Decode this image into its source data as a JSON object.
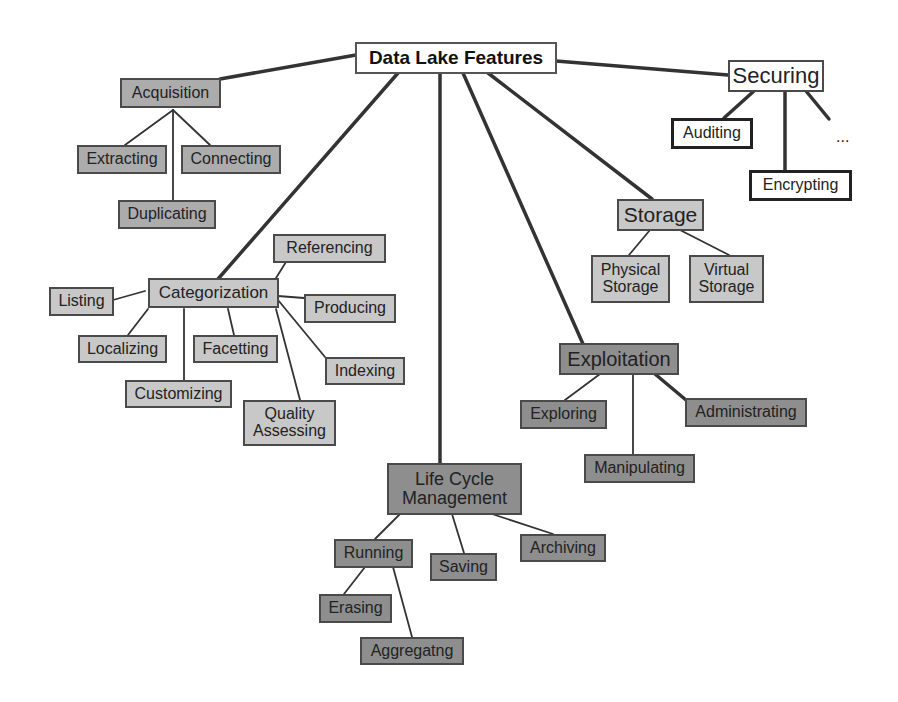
{
  "diagram": {
    "title": "Data Lake Features",
    "colors": {
      "root_fill": "#ffffff",
      "securing_fill": "#ffffff",
      "acquisition_fill": "#acacac",
      "categorization_fill": "#c8c8c8",
      "storage_fill": "#c8c8c8",
      "exploitation_fill": "#8e8e8e",
      "lifecycle_fill": "#8e8e8e",
      "line": "#333333"
    },
    "root": {
      "label": "Data Lake Features"
    },
    "branches": {
      "acquisition": {
        "label": "Acquisition",
        "children": [
          "Extracting",
          "Connecting",
          "Duplicating"
        ]
      },
      "categorization": {
        "label": "Categorization",
        "children": [
          "Referencing",
          "Listing",
          "Producing",
          "Localizing",
          "Facetting",
          "Indexing",
          "Customizing",
          "Quality\nAssessing"
        ]
      },
      "lifecycle": {
        "label": "Life Cycle\nManagement",
        "children": [
          "Running",
          "Saving",
          "Archiving"
        ],
        "running_children": [
          "Erasing",
          "Aggregatng"
        ]
      },
      "exploitation": {
        "label": "Exploitation",
        "children": [
          "Exploring",
          "Administrating",
          "Manipulating"
        ]
      },
      "storage": {
        "label": "Storage",
        "children": [
          "Physical\nStorage",
          "Virtual\nStorage"
        ]
      },
      "securing": {
        "label": "Securing",
        "children": [
          "Auditing",
          "Encrypting"
        ],
        "more": "..."
      }
    }
  }
}
